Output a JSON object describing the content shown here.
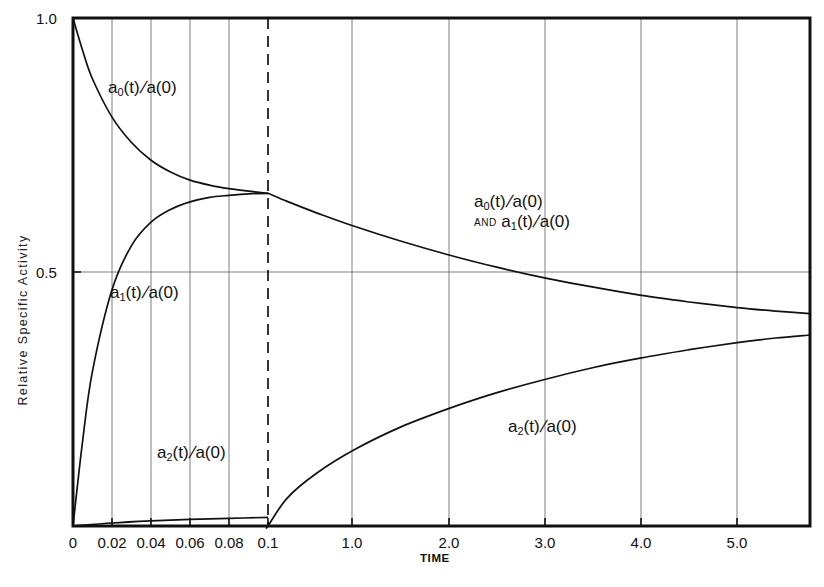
{
  "figure": {
    "background": "#ffffff",
    "ink": "#111111",
    "grid_color": "#6f6f6f",
    "frame_color": "#111111"
  },
  "axes": {
    "x": {
      "label": "TIME",
      "tick_labels": [
        "0",
        "0.02",
        "0.04",
        "0.06",
        "0.08",
        "0.1",
        "1.0",
        "2.0",
        "3.0",
        "4.0",
        "5.0"
      ],
      "tick_values": [
        0,
        0.02,
        0.04,
        0.06,
        0.08,
        0.1,
        1.0,
        2.0,
        3.0,
        4.0,
        5.0
      ],
      "tick_px": [
        73,
        112,
        151,
        190,
        229,
        268,
        352,
        449,
        545,
        641,
        737
      ],
      "break_at": 0.1,
      "break_px": 268,
      "range_left": [
        0,
        0.1
      ],
      "range_right": [
        0.1,
        5.76
      ],
      "grid": true
    },
    "y": {
      "label": "Relative Specific Activity",
      "tick_labels": [
        "1.0",
        "0.5"
      ],
      "tick_values": [
        1.0,
        0.5
      ],
      "tick_px": [
        18,
        272
      ],
      "range": [
        0,
        1.0
      ],
      "grid": true,
      "gridlines_at": [
        0.5
      ]
    }
  },
  "plot_box": {
    "left": 73,
    "top": 18,
    "right": 810,
    "bottom": 526
  },
  "annotations": {
    "a0_left": {
      "base": "a",
      "sub": "0",
      "rest": "(t)",
      "slash": "/",
      "den": "a(0)",
      "x": 108,
      "y": 78
    },
    "a1_left": {
      "base": "a",
      "sub": "1",
      "rest": "(t)",
      "slash": "/",
      "den": "a(0)",
      "x": 110,
      "y": 293
    },
    "a2_left": {
      "base": "a",
      "sub": "2",
      "rest": "(t)",
      "slash": "/",
      "den": "a(0)",
      "x": 157,
      "y": 450
    },
    "a2_right": {
      "base": "a",
      "sub": "2",
      "rest": "(t)",
      "slash": "/",
      "den": "a(0)",
      "x": 508,
      "y": 424
    },
    "combined": {
      "line1": {
        "base": "a",
        "sub": "0",
        "rest": "(t)",
        "slash": "/",
        "den": "a(0)"
      },
      "and": "AND",
      "line2": {
        "base": "a",
        "sub": "1",
        "rest": "(t)",
        "slash": "/",
        "den": "a(0)"
      },
      "x": 474,
      "y": 196
    }
  },
  "chart_data": {
    "type": "line",
    "title": "",
    "xlabel": "TIME",
    "ylabel": "Relative Specific Activity",
    "xlim": [
      0,
      5.76
    ],
    "ylim": [
      0,
      1.0
    ],
    "x_axis_break": 0.1,
    "x_tick_labels": [
      "0",
      "0.02",
      "0.04",
      "0.06",
      "0.08",
      "0.1",
      "1.0",
      "2.0",
      "3.0",
      "4.0",
      "5.0"
    ],
    "y_tick_labels": [
      "1.0",
      "0.5"
    ],
    "grid": true,
    "legend_position": "inline-annotations",
    "series": [
      {
        "name": "a0(t)/a(0)",
        "label": "a_0(t)/a(0)",
        "x": [
          0,
          0.005,
          0.01,
          0.02,
          0.03,
          0.04,
          0.05,
          0.06,
          0.07,
          0.08,
          0.09,
          0.1,
          0.3,
          0.6,
          1.0,
          1.5,
          2.0,
          2.5,
          3.0,
          3.5,
          4.0,
          4.5,
          5.0,
          5.4,
          5.76
        ],
        "y": [
          1.0,
          0.935,
          0.88,
          0.805,
          0.755,
          0.72,
          0.697,
          0.681,
          0.671,
          0.664,
          0.659,
          0.655,
          0.639,
          0.617,
          0.59,
          0.56,
          0.533,
          0.509,
          0.488,
          0.47,
          0.454,
          0.441,
          0.43,
          0.423,
          0.418
        ]
      },
      {
        "name": "a1(t)/a(0)",
        "label": "a_1(t)/a(0)",
        "x": [
          0,
          0.005,
          0.01,
          0.02,
          0.03,
          0.04,
          0.05,
          0.06,
          0.07,
          0.08,
          0.09,
          0.1
        ],
        "y": [
          0.0,
          0.17,
          0.305,
          0.465,
          0.552,
          0.598,
          0.623,
          0.638,
          0.647,
          0.651,
          0.654,
          0.655
        ],
        "note": "merges with a0 curve at t = 0.1 and coincides thereafter"
      },
      {
        "name": "a2(t)/a(0)",
        "label": "a_2(t)/a(0)",
        "x": [
          0,
          0.02,
          0.04,
          0.06,
          0.08,
          0.1,
          0.1,
          0.3,
          0.6,
          1.0,
          1.5,
          2.0,
          2.5,
          3.0,
          3.5,
          4.0,
          4.5,
          5.0,
          5.4,
          5.76
        ],
        "y": [
          0.0,
          0.006,
          0.01,
          0.013,
          0.015,
          0.017,
          0.0,
          0.055,
          0.103,
          0.15,
          0.196,
          0.232,
          0.263,
          0.289,
          0.312,
          0.331,
          0.347,
          0.361,
          0.37,
          0.376
        ]
      }
    ]
  }
}
